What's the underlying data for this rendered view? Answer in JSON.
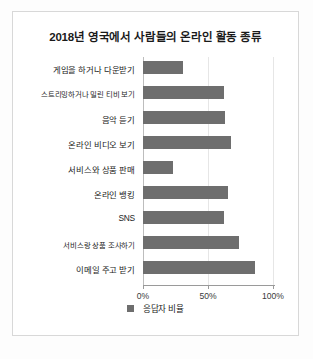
{
  "chart_data": {
    "type": "bar",
    "orientation": "horizontal",
    "title": "2018년 영국에서 사람들의 온라인 활동 종류",
    "xlabel": "",
    "ylabel": "",
    "xlim": [
      0,
      100
    ],
    "grid": true,
    "gridlines_at": [
      0,
      50,
      100
    ],
    "legend_position": "bottom",
    "bar_color": "#6e6e6e",
    "categories": [
      "게임을 하거나 다운받기",
      "스트리밍하거나 밀린 티비 보기",
      "음악 듣기",
      "온라인 비디오 보기",
      "서비스와 상품 판매",
      "온라인 뱅킹",
      "SNS",
      "서비스랑 상품 조사하기",
      "이메일 주고 받기"
    ],
    "values": [
      31,
      62,
      63,
      68,
      23,
      65,
      62,
      74,
      86
    ],
    "series": [
      {
        "name": "응답자 비율",
        "values": [
          31,
          62,
          63,
          68,
          23,
          65,
          62,
          74,
          86
        ]
      }
    ],
    "tick_labels": [
      "0%",
      "50%",
      "100%"
    ],
    "tick_values": [
      0,
      50,
      100
    ],
    "legend": [
      "응답자 비율"
    ]
  },
  "legend": {
    "label": "응답자 비율",
    "swatch_color": "#6e6e6e"
  },
  "caption": {
    "cut_off_text": ""
  }
}
